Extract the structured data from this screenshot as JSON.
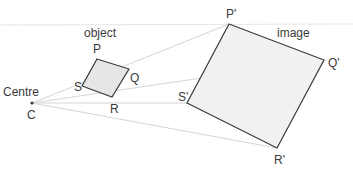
{
  "labels": {
    "centre": "Centre",
    "c": "C",
    "object": "object",
    "image": "image",
    "p": "P",
    "q": "Q",
    "r": "R",
    "s": "S",
    "p_prime": "P'",
    "q_prime": "Q'",
    "r_prime": "R'",
    "s_prime": "S'"
  },
  "colors": {
    "outline": "#3a3a3a",
    "object_fill": "#e6e6e6",
    "image_fill": "#f1f1f1",
    "ray": "#d6d6d6"
  }
}
